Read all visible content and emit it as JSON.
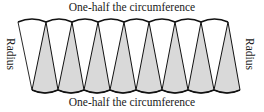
{
  "diagram": {
    "top_label": "One-half the circumference",
    "bottom_label": "One-half the circumference",
    "left_label": "Radius",
    "right_label": "Radius",
    "colors": {
      "sector_fill": "#d9d9d9",
      "outline": "#111111",
      "background": "#ffffff"
    },
    "top_vertices_x": [
      18,
      46,
      72,
      98,
      124,
      149,
      175,
      201,
      228
    ],
    "bottom_vertices_x": [
      32,
      58,
      84,
      110,
      136,
      162,
      188,
      214,
      240
    ],
    "top_y": 22,
    "bottom_y": 90
  }
}
